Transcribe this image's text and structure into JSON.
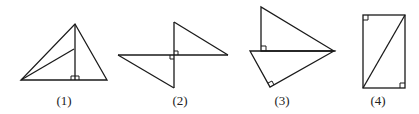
{
  "figures": [
    {
      "id": 1,
      "label": "(1)",
      "label_x": 64
    },
    {
      "id": 2,
      "label": "(2)",
      "label_x": 180
    },
    {
      "id": 3,
      "label": "(3)",
      "label_x": 282
    },
    {
      "id": 4,
      "label": "(4)",
      "label_x": 378
    }
  ],
  "colors": {
    "stroke": "#1a1a1a",
    "background": "#ffffff"
  }
}
